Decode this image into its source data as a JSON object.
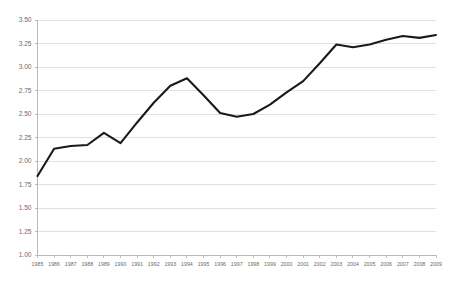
{
  "chart_data": {
    "type": "line",
    "title": "",
    "subtitle": "",
    "xlabel": "",
    "ylabel": "",
    "legend": [],
    "legend_position": "none",
    "grid": true,
    "grid_axis": "y",
    "line_color": "#1a1a1a",
    "grid_color": "#d9d9d9",
    "axis_color": "#b0b0b0",
    "label_color": "#6b6b6b",
    "background_color": "#ffffff",
    "xlim": [
      1985,
      2009
    ],
    "ylim": [
      1.0,
      3.5
    ],
    "ytick_step": 0.25,
    "categories": [
      "1985",
      "1986",
      "1987",
      "1988",
      "1989",
      "1990",
      "1991",
      "1992",
      "1993",
      "1994",
      "1995",
      "1996",
      "1997",
      "1998",
      "1999",
      "2000",
      "2001",
      "2002",
      "2003",
      "2004",
      "2005",
      "2006",
      "2007",
      "2008",
      "2009"
    ],
    "values": [
      1.84,
      2.13,
      2.16,
      2.17,
      2.3,
      2.19,
      2.41,
      2.62,
      2.8,
      2.88,
      2.7,
      2.51,
      2.47,
      2.5,
      2.6,
      2.73,
      2.85,
      3.04,
      3.24,
      3.21,
      3.24,
      3.29,
      3.33,
      3.31,
      3.34
    ],
    "ytick_labels": [
      "1.00",
      "1.25",
      "1.50",
      "1.75",
      "2.00",
      "2.25",
      "2.50",
      "2.75",
      "3.00",
      "3.25",
      "3.50"
    ],
    "ytick_values": [
      1.0,
      1.25,
      1.5,
      1.75,
      2.0,
      2.25,
      2.5,
      2.75,
      3.0,
      3.25,
      3.5
    ],
    "xtick_labels": [
      "1985",
      "1986",
      "1987",
      "1988",
      "1989",
      "1990",
      "1991",
      "1992",
      "1993",
      "1994",
      "1995",
      "1996",
      "1997",
      "1998",
      "1999",
      "2000",
      "2001",
      "2002",
      "2003",
      "2004",
      "2005",
      "2006",
      "2007",
      "2008",
      "2009"
    ]
  }
}
